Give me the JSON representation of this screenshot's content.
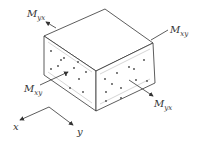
{
  "diagram": {
    "type": "isometric-block-moments",
    "labels": {
      "myx_top": {
        "main": "M",
        "sub": "yx"
      },
      "mxy_right": {
        "main": "M",
        "sub": "xy"
      },
      "mxy_left": {
        "main": "M",
        "sub": "xy"
      },
      "myx_bottom": {
        "main": "M",
        "sub": "yx"
      }
    },
    "axes": {
      "x_label": "x",
      "y_label": "y"
    },
    "colors": {
      "line": "#333333",
      "face_lines": "#999999",
      "background": "#ffffff"
    }
  }
}
